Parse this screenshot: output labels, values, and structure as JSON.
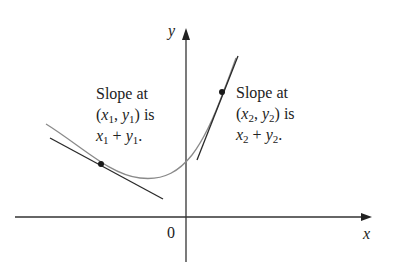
{
  "axes": {
    "x_label": "x",
    "y_label": "y",
    "origin_label": "0"
  },
  "annotations": [
    {
      "id": "point1",
      "line1": "Slope at",
      "point": {
        "x_var": "x",
        "x_sub": "1",
        "y_var": "y",
        "y_sub": "1"
      },
      "line2_suffix": "is",
      "expression": {
        "a_var": "x",
        "a_sub": "1",
        "op": "+",
        "b_var": "y",
        "b_sub": "1",
        "end": "."
      }
    },
    {
      "id": "point2",
      "line1": "Slope at",
      "point": {
        "x_var": "x",
        "x_sub": "2",
        "y_var": "y",
        "y_sub": "2"
      },
      "line2_suffix": "is",
      "expression": {
        "a_var": "x",
        "a_sub": "2",
        "op": "+",
        "b_var": "y",
        "b_sub": "2",
        "end": "."
      }
    }
  ],
  "colors": {
    "axis": "#333333",
    "curve": "#8a8a8a",
    "tangent": "#2a2a2a",
    "point": "#1a1a1a"
  }
}
